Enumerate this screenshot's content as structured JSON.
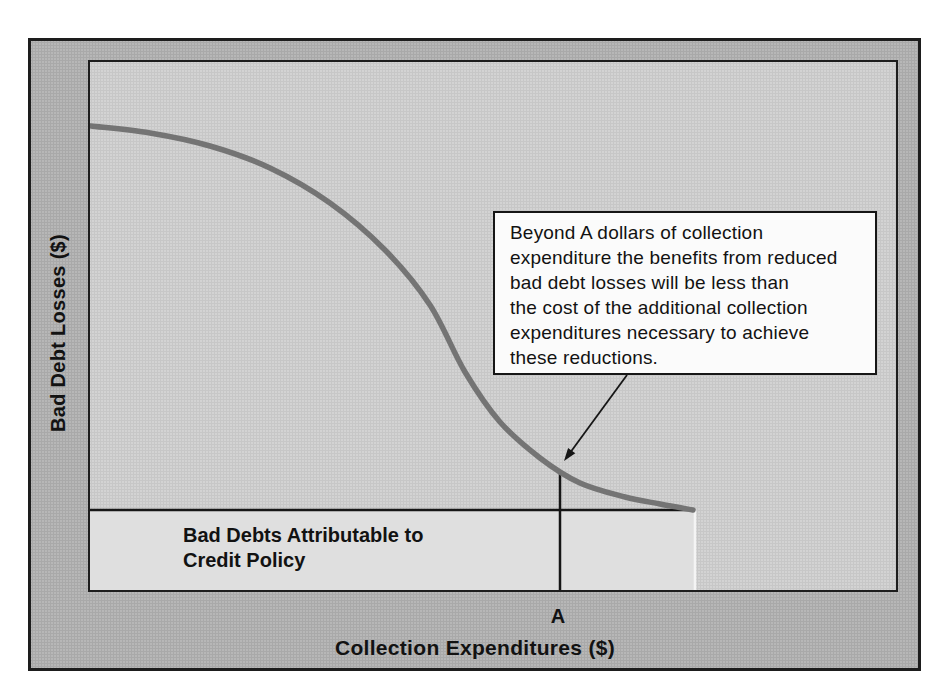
{
  "figure": {
    "ylabel": "Bad Debt Losses ($)",
    "xlabel": "Collection Expenditures ($)",
    "marker_label": "A",
    "baseline_label": "Bad Debts Attributable to\nCredit Policy",
    "annotation_text": "Beyond A dollars of collection\nexpenditure the benefits from reduced\nbad debt losses will be less than\nthe cost of the additional collection\nexpenditures necessary to achieve\nthese reductions."
  },
  "colors": {
    "page_bg": "#ffffff",
    "figure_bg": "#b7b7b7",
    "plot_bg": "#d3d3d3",
    "floor_bg": "#dfdfdf",
    "floor_edge": "#f4f4f4",
    "frame": "#1d1d1d",
    "line": "#161616",
    "curve": "#747474",
    "text": "#121212",
    "annotation_bg": "#fbfbfb"
  },
  "chart_data": {
    "type": "line",
    "title": "",
    "xlabel": "Collection Expenditures ($)",
    "ylabel": "Bad Debt Losses ($)",
    "axis_numeric": false,
    "x_tick_labels": [
      "A"
    ],
    "grid": false,
    "legend": "none",
    "plot_size_px": [
      806,
      528
    ],
    "series": [
      {
        "name": "Bad debt losses vs collection expenditures (declining S-curve)",
        "points_px": [
          [
            1,
            64
          ],
          [
            60,
            71
          ],
          [
            120,
            84
          ],
          [
            180,
            106
          ],
          [
            240,
            141
          ],
          [
            295,
            188
          ],
          [
            340,
            243
          ],
          [
            375,
            310
          ],
          [
            410,
            360
          ],
          [
            450,
            396
          ],
          [
            490,
            421
          ],
          [
            535,
            435
          ],
          [
            570,
            442
          ],
          [
            603,
            448
          ]
        ]
      }
    ],
    "baseline": {
      "label": "Bad Debts Attributable to Credit Policy",
      "y_px": 448,
      "x_start_px": 0,
      "x_end_px": 603
    },
    "floor_region": {
      "x_px": 0,
      "y_px": 448,
      "width_px": 605,
      "height_px": 80
    },
    "marker_line": {
      "label": "A",
      "x_px": 470,
      "y_top_px": 409,
      "y_bottom_px": 528
    },
    "annotation": {
      "text": "Beyond A dollars of collection expenditure the benefits from reduced bad debt losses will be less than the cost of the additional collection expenditures necessary to achieve these reductions.",
      "arrow_from_px": [
        537,
        313
      ],
      "arrow_to_px": [
        474,
        399
      ]
    }
  }
}
